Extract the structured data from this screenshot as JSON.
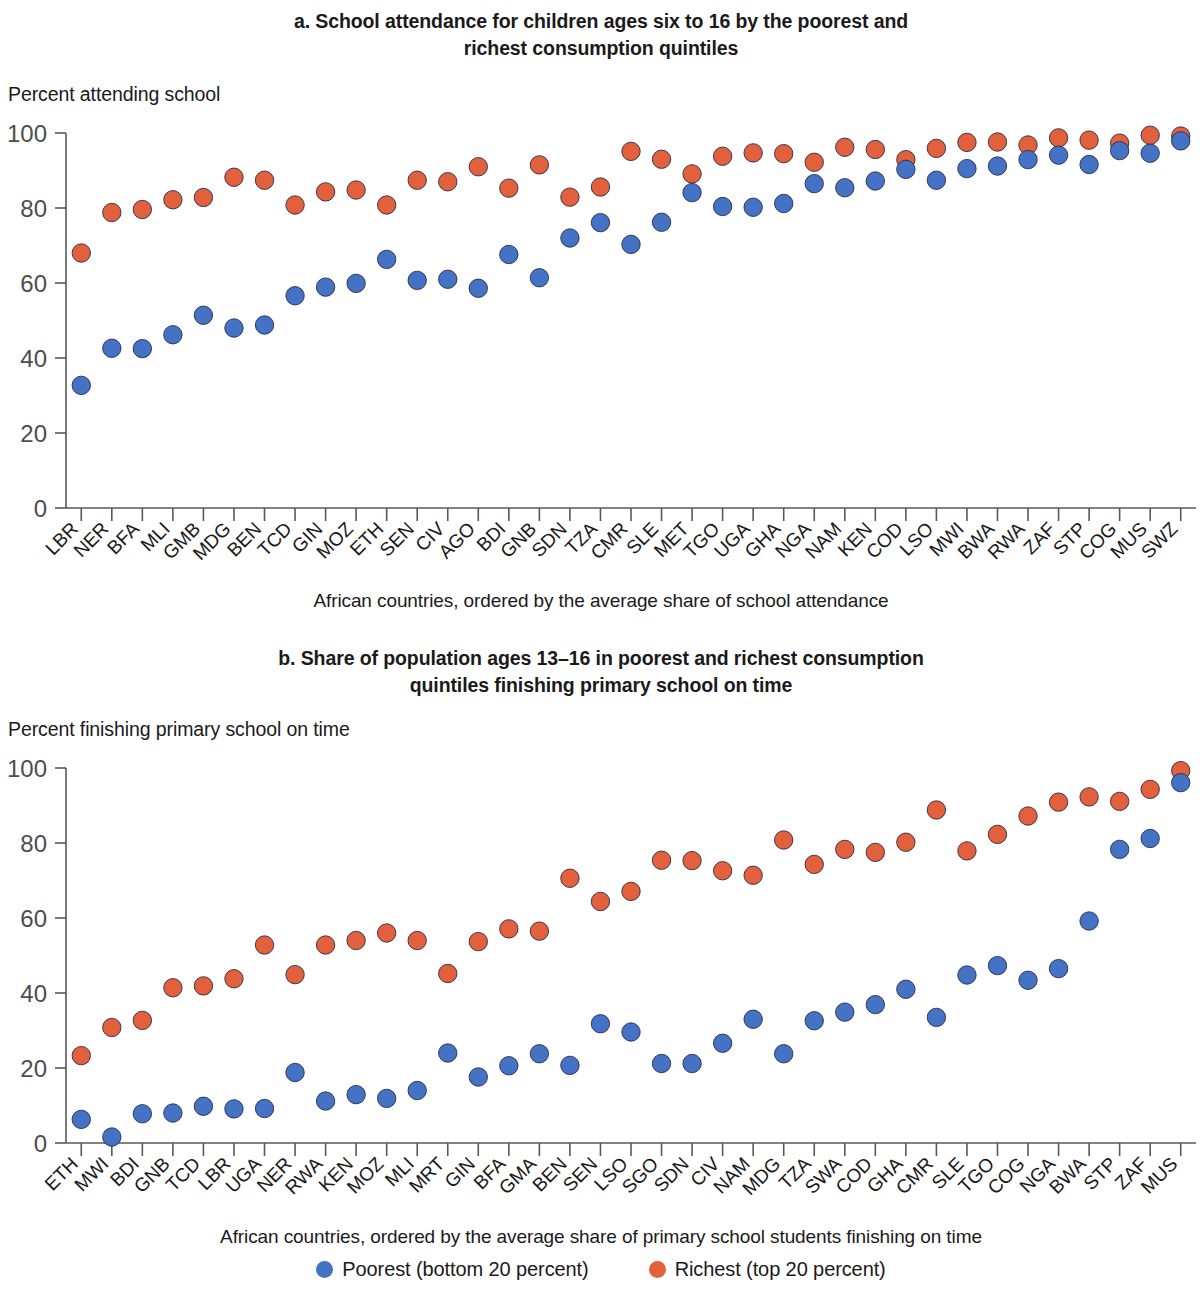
{
  "figure": {
    "legend": {
      "poorest_label": "Poorest (bottom 20 percent)",
      "richest_label": "Richest (top 20 percent)",
      "poorest_color": "#4472c4",
      "richest_color": "#e2603c"
    }
  },
  "panel_a": {
    "title": "a. School attendance for children ages six to 16 by the poorest and richest consumption quintiles",
    "title_line1": "a. School attendance for children ages six to 16 by the poorest and",
    "title_line2": "richest consumption quintiles",
    "ylabel": "Percent attending school",
    "caption": "African countries, ordered by the average share of school attendance"
  },
  "panel_b": {
    "title": "b. Share of population ages 13–16 in poorest and richest consumption quintiles finishing primary school on time",
    "title_line1": "b. Share of population ages 13–16 in poorest and richest consumption",
    "title_line2": "quintiles finishing primary school on time",
    "ylabel": "Percent finishing primary school on time",
    "caption": "African countries, ordered by the average share of primary school students finishing on time"
  },
  "chart_data": [
    {
      "type": "scatter",
      "panel": "a",
      "title": "a. School attendance for children ages six to 16 by the poorest and richest consumption quintiles",
      "xlabel": "African countries, ordered by the average share of school attendance",
      "ylabel": "Percent attending school",
      "ylim": [
        0,
        100
      ],
      "yticks": [
        0,
        20,
        40,
        60,
        80,
        100
      ],
      "grid": false,
      "legend_position": "bottom",
      "categories": [
        "LBR",
        "NER",
        "BFA",
        "MLI",
        "GMB",
        "MDG",
        "BEN",
        "TCD",
        "GIN",
        "MOZ",
        "ETH",
        "SEN",
        "CIV",
        "AGO",
        "BDI",
        "GNB",
        "SDN",
        "TZA",
        "CMR",
        "SLE",
        "MET",
        "TGO",
        "UGA",
        "GHA",
        "NGA",
        "NAM",
        "KEN",
        "COD",
        "LSO",
        "MWI",
        "BWA",
        "RWA",
        "ZAF",
        "STP",
        "COG",
        "MUS",
        "SWZ"
      ],
      "series": [
        {
          "name": "Poorest (bottom 20 percent)",
          "color": "#4472c4",
          "values": [
            32.7,
            42.6,
            42.5,
            46.2,
            51.4,
            48.0,
            48.8,
            56.6,
            58.9,
            59.9,
            66.3,
            60.7,
            61.0,
            58.6,
            67.6,
            61.4,
            72.0,
            76.1,
            70.3,
            76.2,
            84.1,
            80.4,
            80.2,
            81.2,
            86.5,
            85.4,
            87.2,
            90.3,
            87.4,
            90.5,
            91.2,
            92.9,
            94.1,
            91.6,
            95.3,
            94.6,
            97.9
          ]
        },
        {
          "name": "Richest (top 20 percent)",
          "color": "#e2603c",
          "values": [
            68.0,
            78.8,
            79.6,
            82.2,
            82.8,
            88.2,
            87.4,
            80.8,
            84.3,
            84.8,
            80.8,
            87.4,
            87.0,
            91.0,
            85.3,
            91.5,
            82.9,
            85.6,
            95.1,
            93.0,
            89.1,
            93.8,
            94.7,
            94.5,
            92.2,
            96.2,
            95.6,
            92.9,
            95.9,
            97.5,
            97.6,
            96.8,
            98.7,
            98.1,
            97.3,
            99.4,
            99.2
          ]
        }
      ]
    },
    {
      "type": "scatter",
      "panel": "b",
      "title": "b. Share of population ages 13–16 in poorest and richest consumption quintiles finishing primary school on time",
      "xlabel": "African countries, ordered by the average share of primary school students finishing on time",
      "ylabel": "Percent finishing primary school on time",
      "ylim": [
        0,
        100
      ],
      "yticks": [
        0,
        20,
        40,
        60,
        80,
        100
      ],
      "grid": false,
      "legend_position": "bottom",
      "categories": [
        "ETH",
        "MWI",
        "BDI",
        "GNB",
        "TCD",
        "LBR",
        "UGA",
        "NER",
        "RWA",
        "KEN",
        "MOZ",
        "MLI",
        "MRT",
        "GIN",
        "BFA",
        "GMA",
        "BEN",
        "SEN",
        "LSO",
        "SGO",
        "SDN",
        "CIV",
        "NAM",
        "MDG",
        "TZA",
        "SWA",
        "COD",
        "GHA",
        "CMR",
        "SLE",
        "TGO",
        "COG",
        "NGA",
        "BWA",
        "STP",
        "ZAF",
        "MUS"
      ],
      "series": [
        {
          "name": "Poorest (bottom 20 percent)",
          "color": "#4472c4",
          "values": [
            6.3,
            1.6,
            7.8,
            8.0,
            9.8,
            9.1,
            9.2,
            18.8,
            11.2,
            12.9,
            11.9,
            14.0,
            24.0,
            17.6,
            20.6,
            23.8,
            20.7,
            31.8,
            29.6,
            21.2,
            21.2,
            26.6,
            33.0,
            23.8,
            32.6,
            34.9,
            36.9,
            41.0,
            33.5,
            44.8,
            47.3,
            43.4,
            46.5,
            59.2,
            78.3,
            81.2,
            96.1
          ]
        },
        {
          "name": "Richest (top 20 percent)",
          "color": "#e2603c",
          "values": [
            23.3,
            30.8,
            32.7,
            41.4,
            41.9,
            43.8,
            52.8,
            44.9,
            52.8,
            54.0,
            56.0,
            54.0,
            45.2,
            53.7,
            57.1,
            56.5,
            70.6,
            64.4,
            67.1,
            75.4,
            75.3,
            72.6,
            71.4,
            80.8,
            74.3,
            78.3,
            77.5,
            80.2,
            88.8,
            77.9,
            82.3,
            87.2,
            90.9,
            92.3,
            91.1,
            94.3,
            99.3
          ]
        }
      ]
    }
  ]
}
